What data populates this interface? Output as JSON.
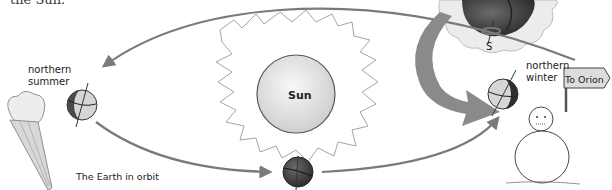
{
  "caption_fragment": "the Sun.",
  "diagram": {
    "title": "The Earth in orbit",
    "center_body": {
      "label": "Sun"
    },
    "positions": [
      {
        "id": "summer",
        "label_line1": "northern",
        "label_line2": "summer"
      },
      {
        "id": "winter",
        "label_line1": "northern",
        "label_line2": "winter"
      },
      {
        "id": "bottom",
        "label_line1": "",
        "label_line2": ""
      }
    ],
    "inset": {
      "pole_label": "S"
    },
    "signpost": {
      "label": "To Orion"
    },
    "decorations": [
      "ice-cream-cone",
      "snowman",
      "sun-flames",
      "inset-cloud"
    ],
    "colors": {
      "orbit_arrow": "#7a7a7a",
      "big_arrow": "#8a8a8a",
      "sun_fill": "#e6e6e6",
      "globe_dark": "#4a4a4a",
      "globe_light": "#d6d6d6",
      "cloud_fill": "#ececec"
    }
  }
}
